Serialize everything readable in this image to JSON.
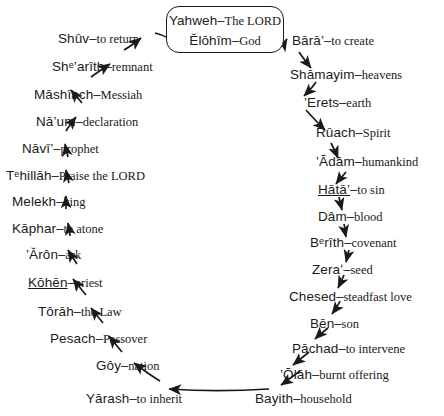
{
  "diagram": {
    "title_box": {
      "lines": [
        {
          "hebrew": "Yahweh",
          "dash": "–",
          "gloss": "The L",
          "gloss_smallcaps": "ORD"
        },
        {
          "hebrew": "Ĕlōhîm",
          "dash": "–",
          "gloss": "God",
          "gloss_smallcaps": ""
        }
      ]
    },
    "terms": [
      {
        "hebrew": "Bārā’",
        "dash": "–",
        "gloss": "to create"
      },
      {
        "hebrew": "Shāmayim",
        "dash": "–",
        "gloss": "heavens"
      },
      {
        "hebrew": "’Erets",
        "dash": "–",
        "gloss": "earth"
      },
      {
        "hebrew": "Rûach",
        "dash": "–",
        "gloss": "Spirit"
      },
      {
        "hebrew": "’Ādâm",
        "dash": "–",
        "gloss": "humankind"
      },
      {
        "hebrew": "Hātā’",
        "dash": "–",
        "gloss": "to sin"
      },
      {
        "hebrew": "Dâm",
        "dash": "–",
        "gloss": "blood"
      },
      {
        "hebrew": "Bᵉrîth",
        "dash": "–",
        "gloss": "covenant"
      },
      {
        "hebrew": "Zeraʻ",
        "dash": "–",
        "gloss": "seed"
      },
      {
        "hebrew": "Chesed",
        "dash": "–",
        "gloss": "steadfast love"
      },
      {
        "hebrew": "Bēn",
        "dash": "–",
        "gloss": "son"
      },
      {
        "hebrew": "Pāchad",
        "dash": "–",
        "gloss": "to intervene"
      },
      {
        "hebrew": "’Ōlāh",
        "dash": "–",
        "gloss": "burnt offering"
      },
      {
        "hebrew": "Bayith",
        "dash": "–",
        "gloss": "household"
      },
      {
        "hebrew": "Yārash",
        "dash": "–",
        "gloss": "to inherit"
      },
      {
        "hebrew": "Gôy",
        "dash": "–",
        "gloss": "nation"
      },
      {
        "hebrew": "Pesach",
        "dash": "–",
        "gloss": "Passover"
      },
      {
        "hebrew": "Tôrāh",
        "dash": "–",
        "gloss": "the Law"
      },
      {
        "hebrew": "Kōhēn",
        "dash": "–",
        "gloss": "priest"
      },
      {
        "hebrew": "’Ărôn",
        "dash": "–",
        "gloss": "ark"
      },
      {
        "hebrew": "Kāphar",
        "dash": "–",
        "gloss": "to atone"
      },
      {
        "hebrew": "Melekh",
        "dash": "–",
        "gloss": "king"
      },
      {
        "hebrew": "Tᵉhillāh",
        "dash": "–",
        "gloss": "Praise the L",
        "gloss_smallcaps": "ORD"
      },
      {
        "hebrew": "Nāvî’",
        "dash": "–",
        "gloss": "prophet"
      },
      {
        "hebrew": "Nā’um",
        "dash": "–",
        "gloss": "declaration"
      },
      {
        "hebrew": "Māshîach",
        "dash": "–",
        "gloss": "Messiah"
      },
      {
        "hebrew": "Shᵉ’arîth",
        "dash": "–",
        "gloss": "remnant"
      },
      {
        "hebrew": "Shûv",
        "dash": "–",
        "gloss": "to return"
      }
    ]
  },
  "colors": {
    "ink": "#1a1a1a",
    "background": "#ffffff"
  }
}
